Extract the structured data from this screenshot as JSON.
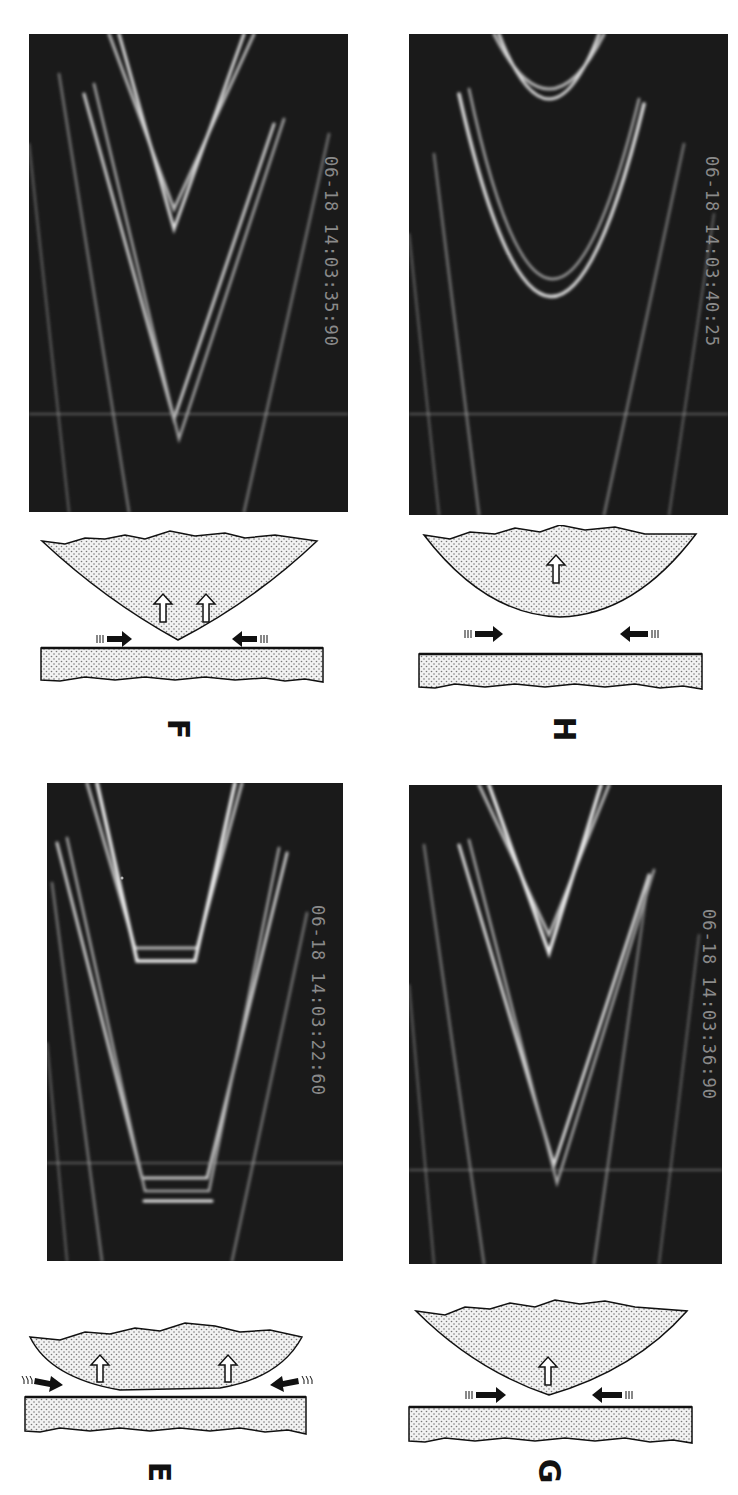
{
  "figure": {
    "panels": [
      {
        "id": "F",
        "label": "F",
        "timestamp": "06-18 14:03:35:90",
        "fringe_shape": "sharp V (point contact at lens tip)",
        "up_arrows": 2
      },
      {
        "id": "H",
        "label": "H",
        "timestamp": "06-18 14:03:40:25",
        "fringe_shape": "rounded U (lens separated from plate)",
        "up_arrows": 1
      },
      {
        "id": "E",
        "label": "E",
        "timestamp": "06-18 14:03:22:60",
        "fringe_shape": "flat-bottomed V (flattened contact region)",
        "up_arrows": 2
      },
      {
        "id": "G",
        "label": "G",
        "timestamp": "06-18 14:03:36:90",
        "fringe_shape": "sharp V (point contact)",
        "up_arrows": 1
      }
    ],
    "colors": {
      "photo_background": "#1a1a1a",
      "fringe": "#e8e8e8",
      "timestamp": "#8a8a8a",
      "diagram_fill": "#e6e6e6",
      "diagram_stroke": "#111111",
      "label": "#111111"
    }
  }
}
